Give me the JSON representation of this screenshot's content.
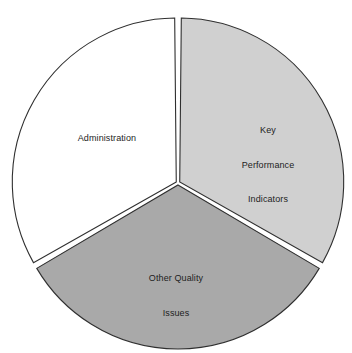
{
  "chart_data": {
    "type": "pie",
    "title": "",
    "subtitle": "",
    "xlabel": "",
    "ylabel": "",
    "grid": false,
    "legend_position": "none",
    "labels_inside_slices": true,
    "categories": [
      "Key Performance Indicators",
      "Other Quality Issues",
      "Administration"
    ],
    "values": [
      33.3,
      33.3,
      33.3
    ],
    "slices": [
      {
        "label": "Key Performance Indicators",
        "label_lines": [
          "Key",
          "Performance",
          "Indicators"
        ],
        "value": 33.3,
        "start_angle_deg": 0,
        "end_angle_deg": 120,
        "color": "#d0d0d0",
        "border_color": "#2f2f2f"
      },
      {
        "label": "Other Quality Issues",
        "label_lines": [
          "Other Quality",
          "Issues"
        ],
        "value": 33.3,
        "start_angle_deg": 120,
        "end_angle_deg": 240,
        "color": "#a9a9a9",
        "border_color": "#2f2f2f"
      },
      {
        "label": "Administration",
        "label_lines": [
          "Administration"
        ],
        "value": 33.3,
        "start_angle_deg": 240,
        "end_angle_deg": 360,
        "color": "#ffffff",
        "border_color": "#2f2f2f"
      }
    ]
  },
  "labels": {
    "administration": "Administration",
    "kpi_line1": "Key",
    "kpi_line2": "Performance",
    "kpi_line3": "Indicators",
    "other_line1": "Other Quality",
    "other_line2": "Issues"
  },
  "colors": {
    "background": "#ffffff",
    "slice_white": "#ffffff",
    "slice_light_gray": "#d0d0d0",
    "slice_dark_gray": "#a9a9a9",
    "outline": "#2f2f2f",
    "text": "#1d1d1d"
  },
  "geometry": {
    "center_x": 178,
    "center_y": 183,
    "radius": 164
  }
}
